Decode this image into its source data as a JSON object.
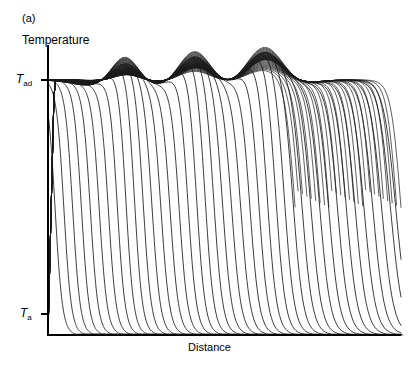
{
  "figure": {
    "panel_label": "(a)",
    "type": "scientific-line-plot"
  },
  "axes": {
    "ylabel": "Temperature",
    "xlabel": "Distance",
    "ytick_labels": [
      {
        "symbol": "T",
        "subscript": "ad",
        "value_y": 80
      },
      {
        "symbol": "T",
        "subscript": "a",
        "value_y": 314
      }
    ],
    "x_axis_px": {
      "start": 48,
      "end": 401,
      "y": 335
    },
    "y_axis_px": {
      "x": 48,
      "top": 45,
      "bottom": 335
    }
  },
  "chart_data": {
    "type": "line",
    "title": "(a)",
    "xlabel": "Distance",
    "ylabel": "Temperature",
    "xlim": [
      0,
      1
    ],
    "ylim": [
      0,
      1
    ],
    "grid": false,
    "legend": null,
    "y_reference_levels": [
      {
        "name": "T_ad",
        "label": "Tad",
        "y": 0.88
      },
      {
        "name": "T_a",
        "label": "Ta",
        "y": 0.0
      }
    ],
    "n_series": 46,
    "peaks": [
      {
        "index": 1,
        "x": 0.218,
        "y_top": 0.965
      },
      {
        "index": 2,
        "x": 0.416,
        "y_top": 0.985
      },
      {
        "index": 3,
        "x": 0.614,
        "y_top": 1.0
      }
    ],
    "valleys": [
      {
        "x": 0.12,
        "y": 0.878
      },
      {
        "x": 0.317,
        "y": 0.862
      },
      {
        "x": 0.515,
        "y": 0.858
      },
      {
        "x": 0.7,
        "y": 0.868
      }
    ],
    "envelope_note": "Peak amplitude above T_ad increases with each successive oscillation; peak width also increases slightly.",
    "front_origin": {
      "x": 0.0,
      "y": 0.88
    },
    "front_positions_x": [
      0.02,
      0.045,
      0.07,
      0.095,
      0.12,
      0.145,
      0.17,
      0.195,
      0.22,
      0.245,
      0.27,
      0.295,
      0.32,
      0.345,
      0.37,
      0.395,
      0.42,
      0.445,
      0.47,
      0.495,
      0.52,
      0.545,
      0.57,
      0.595,
      0.62,
      0.645,
      0.67,
      0.695,
      0.72,
      0.745,
      0.77,
      0.795,
      0.82,
      0.845,
      0.87,
      0.895,
      0.92,
      0.945,
      0.97,
      0.985
    ]
  },
  "style": {
    "line_color": "#1a1a1a",
    "axis_color": "#000000",
    "background": "#ffffff"
  }
}
